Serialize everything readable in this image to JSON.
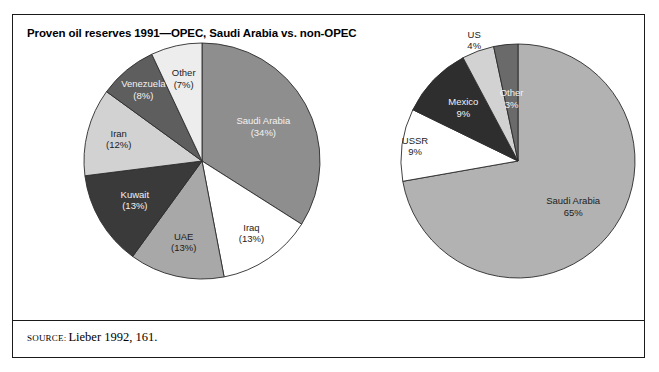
{
  "figure": {
    "title": "Proven oil reserves 1991—OPEC, Saudi Arabia vs. non-OPEC",
    "source_label": "SOURCE:",
    "source_text": "Lieber 1992, 161.",
    "border_color": "#1a1a1a",
    "background_color": "#ffffff"
  },
  "chart_data": [
    {
      "type": "pie",
      "id": "opec",
      "title": "",
      "legend": "inside-slice-labels",
      "units": "percent",
      "start_angle_deg": 0,
      "direction": "clockwise",
      "categories": [
        "Saudi Arabia",
        "Iraq",
        "UAE",
        "Kuwait",
        "Iran",
        "Venezuela",
        "Other"
      ],
      "values": [
        34,
        13,
        13,
        13,
        12,
        8,
        7
      ],
      "labels": [
        {
          "name": "Saudi Arabia",
          "value": 34,
          "line1": "Saudi Arabia",
          "line2": "(34%)",
          "color": "#8e8e8e",
          "text_color": "#f2f2f2"
        },
        {
          "name": "Iraq",
          "value": 13,
          "line1": "Iraq",
          "line2": "(13%)",
          "color": "#ffffff",
          "text_color": "#1c1c1c"
        },
        {
          "name": "UAE",
          "value": 13,
          "line1": "UAE",
          "line2": "(13%)",
          "color": "#a8a8a8",
          "text_color": "#1c1c1c"
        },
        {
          "name": "Kuwait",
          "value": 13,
          "line1": "Kuwait",
          "line2": "(13%)",
          "color": "#3a3a3a",
          "text_color": "#f2f2f2"
        },
        {
          "name": "Iran",
          "value": 12,
          "line1": "Iran",
          "line2": "(12%)",
          "color": "#d2d2d2",
          "text_color": "#1c1c1c"
        },
        {
          "name": "Venezuela",
          "value": 8,
          "line1": "Venezuela",
          "line2": "(8%)",
          "color": "#5e5e5e",
          "text_color": "#f2f2f2"
        },
        {
          "name": "Other",
          "value": 7,
          "line1": "Other",
          "line2": "(7%)",
          "color": "#ededed",
          "text_color": "#1c1c1c"
        }
      ]
    },
    {
      "type": "pie",
      "id": "non-opec",
      "title": "",
      "legend": "inside-and-outside-slice-labels",
      "units": "percent",
      "start_angle_deg": 0,
      "direction": "clockwise",
      "categories": [
        "Saudi Arabia",
        "USSR",
        "Mexico",
        "US",
        "Other"
      ],
      "values": [
        65,
        9,
        9,
        4,
        3
      ],
      "labels": [
        {
          "name": "Saudi Arabia",
          "value": 65,
          "line1": "Saudi Arabia",
          "line2": "65%",
          "color": "#b2b2b2",
          "text_color": "#1c1c1c"
        },
        {
          "name": "USSR",
          "value": 9,
          "line1": "USSR",
          "line2": "9%",
          "color": "#ffffff",
          "text_color": "#1c1c1c"
        },
        {
          "name": "Mexico",
          "value": 9,
          "line1": "Mexico",
          "line2": "9%",
          "color": "#2e2e2e",
          "text_color": "#f2f2f2"
        },
        {
          "name": "US",
          "value": 4,
          "line1": "US",
          "line2": "4%",
          "color": "#d2d2d2",
          "text_color": "#1c1c1c"
        },
        {
          "name": "Other",
          "value": 3,
          "line1": "Other",
          "line2": "3%",
          "color": "#6a6a6a",
          "text_color": "#f2f2f2"
        }
      ]
    }
  ]
}
